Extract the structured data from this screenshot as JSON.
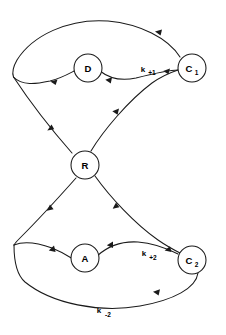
{
  "diagram": {
    "canvas": {
      "width": 226,
      "height": 335
    },
    "background_color": "#ffffff",
    "stroke_color": "#1a1a1a",
    "nodes": [
      {
        "id": "D",
        "label": "D",
        "subscript": "",
        "cx": 88,
        "cy": 68,
        "r": 14
      },
      {
        "id": "C1",
        "label": "C",
        "subscript": "1",
        "cx": 192,
        "cy": 68,
        "r": 14
      },
      {
        "id": "R",
        "label": "R",
        "subscript": "",
        "cx": 85,
        "cy": 165,
        "r": 14
      },
      {
        "id": "A",
        "label": "A",
        "subscript": "",
        "cx": 85,
        "cy": 258,
        "r": 14
      },
      {
        "id": "C2",
        "label": "C",
        "subscript": "2",
        "cx": 192,
        "cy": 260,
        "r": 14
      }
    ],
    "rate_labels": [
      {
        "id": "k-plus-1",
        "base": "k",
        "subscript": "+1",
        "x": 147,
        "y": 70
      },
      {
        "id": "k-plus-2",
        "base": "k",
        "subscript": "+2",
        "x": 149,
        "y": 255
      },
      {
        "id": "k-minus-2",
        "base": "k",
        "subscript": "-2",
        "x": 104,
        "y": 312
      }
    ],
    "edges": [
      {
        "id": "c1-to-left-top",
        "from": "C1",
        "to": "cusp-top",
        "direction": "leftward"
      },
      {
        "id": "left-top-to-d",
        "from": "cusp-top",
        "to": "D",
        "direction": "rightward"
      },
      {
        "id": "d-to-c1",
        "from": "D",
        "to": "k-plus-1",
        "direction": "rightward"
      },
      {
        "id": "cusp-top-to-r",
        "from": "cusp-top",
        "to": "R",
        "direction": "downward"
      },
      {
        "id": "r-to-c1",
        "from": "R",
        "to": "C1",
        "direction": "up-right"
      },
      {
        "id": "r-to-cusp-bottom",
        "from": "R",
        "to": "cusp-bottom",
        "direction": "down-left"
      },
      {
        "id": "r-to-c2",
        "from": "R",
        "to": "C2",
        "direction": "down-right"
      },
      {
        "id": "cusp-bottom-to-a",
        "from": "cusp-bottom",
        "to": "A",
        "direction": "rightward"
      },
      {
        "id": "a-to-c2",
        "from": "A",
        "to": "C2",
        "direction": "rightward"
      },
      {
        "id": "c2-to-cusp-bottom",
        "from": "C2",
        "to": "cusp-bottom",
        "direction": "leftward"
      }
    ]
  }
}
